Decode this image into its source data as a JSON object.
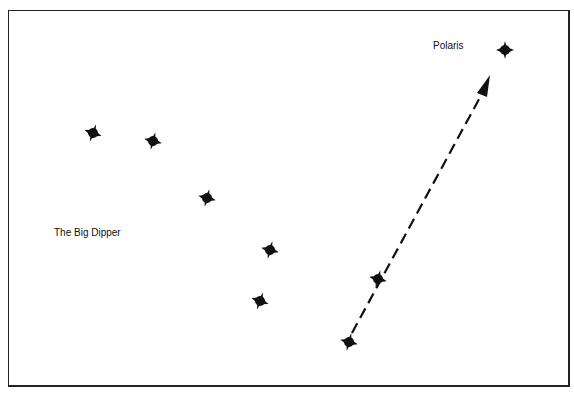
{
  "diagram": {
    "labels": {
      "polaris": "Polaris",
      "big_dipper": "The Big Dipper"
    },
    "stars": [
      {
        "name": "dipper-star-1",
        "x": 93,
        "y": 133
      },
      {
        "name": "dipper-star-2",
        "x": 153,
        "y": 141
      },
      {
        "name": "dipper-star-3",
        "x": 207,
        "y": 198
      },
      {
        "name": "dipper-star-4",
        "x": 270,
        "y": 250
      },
      {
        "name": "dipper-star-5",
        "x": 260,
        "y": 301
      },
      {
        "name": "pointer-star-merak",
        "x": 349,
        "y": 342
      },
      {
        "name": "pointer-star-dubhe",
        "x": 378,
        "y": 279
      },
      {
        "name": "polaris",
        "x": 505,
        "y": 50
      }
    ],
    "arrow": {
      "from": [
        349,
        342
      ],
      "to": [
        490,
        77
      ],
      "style": "dashed"
    },
    "colors": {
      "ink": "#111111",
      "background": "#ffffff"
    }
  }
}
